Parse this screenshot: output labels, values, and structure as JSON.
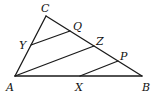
{
  "diagram": {
    "type": "geometry-triangle",
    "stroke_color": "#1a1a1a",
    "points": {
      "A": {
        "x": 15,
        "y": 76
      },
      "B": {
        "x": 142,
        "y": 76
      },
      "C": {
        "x": 46,
        "y": 16
      },
      "Y": {
        "x": 31,
        "y": 45
      },
      "Q": {
        "x": 70,
        "y": 31
      },
      "Z": {
        "x": 94,
        "y": 46
      },
      "P": {
        "x": 118,
        "y": 61
      },
      "X": {
        "x": 80,
        "y": 76
      }
    },
    "segments": [
      {
        "from": "A",
        "to": "B"
      },
      {
        "from": "B",
        "to": "C"
      },
      {
        "from": "C",
        "to": "A"
      },
      {
        "from": "Y",
        "to": "Q"
      },
      {
        "from": "A",
        "to": "Z"
      },
      {
        "from": "X",
        "to": "P"
      }
    ],
    "labels": {
      "A": "A",
      "B": "B",
      "C": "C",
      "Y": "Y",
      "Q": "Q",
      "Z": "Z",
      "P": "P",
      "X": "X"
    }
  }
}
